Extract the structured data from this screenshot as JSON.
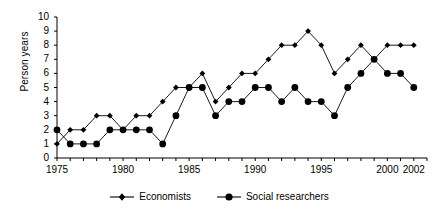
{
  "chart_data": {
    "type": "line",
    "title": "",
    "subtitle": "",
    "xlabel": "",
    "ylabel": "Person years",
    "xlim": [
      1975,
      2003
    ],
    "ylim": [
      0,
      10
    ],
    "yticks": [
      0,
      1,
      2,
      3,
      4,
      5,
      6,
      7,
      8,
      9,
      10
    ],
    "xticks": [
      1975,
      1980,
      1985,
      1990,
      1995,
      2000,
      2002
    ],
    "xtick_labels": [
      "1975",
      "1980",
      "1985",
      "1990",
      "1995",
      "2000",
      "2002"
    ],
    "x_minor_tick_interval": 1,
    "grid": false,
    "legend_position": "bottom-center",
    "x": [
      1975,
      1976,
      1977,
      1978,
      1979,
      1980,
      1981,
      1982,
      1983,
      1984,
      1985,
      1986,
      1987,
      1988,
      1989,
      1990,
      1991,
      1992,
      1993,
      1994,
      1995,
      1996,
      1997,
      1998,
      1999,
      2000,
      2001,
      2002
    ],
    "series": [
      {
        "name": "Economists",
        "marker": "diamond",
        "color": "#000000",
        "values": [
          1,
          2,
          2,
          3,
          3,
          2,
          3,
          3,
          4,
          5,
          5,
          6,
          4,
          5,
          6,
          6,
          7,
          8,
          8,
          9,
          8,
          6,
          7,
          8,
          7,
          8,
          8,
          8
        ]
      },
      {
        "name": "Social researchers",
        "marker": "circle",
        "color": "#000000",
        "values": [
          2,
          1,
          1,
          1,
          2,
          2,
          2,
          2,
          1,
          3,
          5,
          5,
          3,
          4,
          4,
          5,
          5,
          4,
          5,
          4,
          4,
          3,
          5,
          6,
          7,
          6,
          6,
          5
        ]
      }
    ]
  },
  "axis": {
    "y_label": "Person years",
    "y_tick_labels": [
      "0",
      "1",
      "2",
      "3",
      "4",
      "5",
      "6",
      "7",
      "8",
      "9",
      "10"
    ],
    "x_tick_labels": [
      "1975",
      "1980",
      "1985",
      "1990",
      "1995",
      "2000",
      "2002"
    ]
  },
  "legend": {
    "items": [
      {
        "label": "Economists",
        "marker": "diamond-marker-icon"
      },
      {
        "label": "Social researchers",
        "marker": "circle-marker-icon"
      }
    ]
  },
  "style": {
    "line_color": "#000000",
    "axis_color": "#000000",
    "background": "#ffffff"
  }
}
